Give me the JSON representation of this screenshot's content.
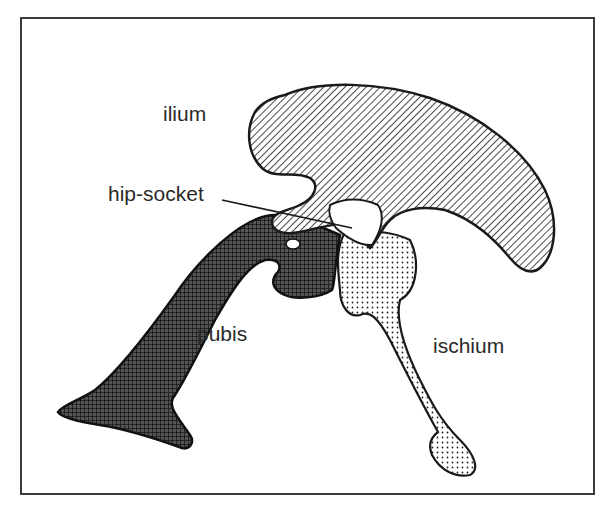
{
  "diagram": {
    "type": "anatomical-illustration",
    "labels": {
      "ilium": "ilium",
      "hip_socket": "hip-socket",
      "pubis": "pubis",
      "ischium": "ischium"
    },
    "fills": {
      "ilium": "diagonal-hatch",
      "pubis": "crosshatch",
      "ischium": "dots",
      "hip_socket": "blank"
    },
    "colors": {
      "ink": "#1a1a1a",
      "background": "#ffffff"
    }
  }
}
